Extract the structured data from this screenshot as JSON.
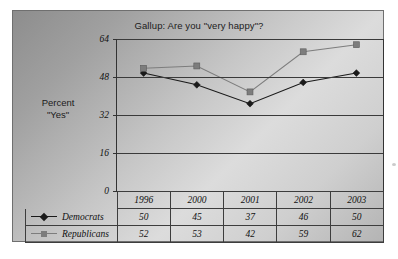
{
  "chart_data": {
    "type": "line",
    "title": "Gallup:  Are you \"very happy\"?",
    "xlabel": "",
    "ylabel": "Percent \"Yes\"",
    "ylabel_lines": [
      "Percent",
      "\"Yes\""
    ],
    "categories": [
      "1996",
      "2000",
      "2001",
      "2002",
      "2003"
    ],
    "ylim": [
      0,
      64
    ],
    "yticks": [
      0,
      16,
      32,
      48,
      64
    ],
    "ytick_labels": [
      "0",
      "16",
      "32",
      "48",
      "64"
    ],
    "grid": true,
    "grid_axis": "y",
    "legend_position": "table-first-column",
    "series": [
      {
        "name": "Democrats",
        "values": [
          50,
          45,
          37,
          46,
          50
        ],
        "color": "#1a1a1a",
        "marker": "diamond"
      },
      {
        "name": "Republicans",
        "values": [
          52,
          53,
          42,
          59,
          62
        ],
        "color": "#7d7d7d",
        "marker": "square"
      }
    ]
  },
  "table": {
    "year_header": [
      "1996",
      "2000",
      "2001",
      "2002",
      "2003"
    ],
    "rows": [
      {
        "label": "Democrats",
        "values": [
          "50",
          "45",
          "37",
          "46",
          "50"
        ]
      },
      {
        "label": "Republicans",
        "values": [
          "52",
          "53",
          "42",
          "59",
          "62"
        ]
      }
    ]
  },
  "colors": {
    "democrats": "#1a1a1a",
    "republicans": "#7d7d7d",
    "axis": "#333333",
    "gridline": "#3a3a3a",
    "text": "#111111"
  }
}
